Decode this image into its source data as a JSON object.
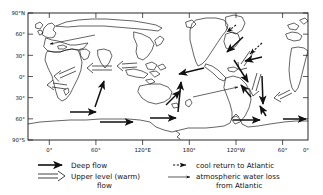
{
  "figure": {
    "type": "map-diagram"
  },
  "axes": {
    "y_labels": [
      "90°N",
      "60°",
      "30°",
      "0°",
      "30°",
      "60°",
      "90°S"
    ],
    "y_values": [
      90,
      60,
      30,
      0,
      -30,
      -60,
      -90
    ],
    "x_labels": [
      "0°",
      "60°",
      "120°E",
      "180°",
      "120°W",
      "60°",
      "0°"
    ],
    "x_values": [
      0,
      60,
      120,
      180,
      240,
      300,
      360
    ],
    "frame_color": "#111111"
  },
  "legend": {
    "items": [
      {
        "symbol": "solid-arrow",
        "label": "Deep  flow"
      },
      {
        "symbol": "hollow-arrow",
        "label": "Upper level (warm)",
        "label2": "flow"
      },
      {
        "symbol": "dashed-short-arrow",
        "label": "cool return to Atlantic"
      },
      {
        "symbol": "thin-line-arrow",
        "label": "atmospheric  water loss",
        "label2": "from  Atlantic"
      }
    ]
  },
  "arrows": {
    "deep_flow": [
      {
        "x1": 70,
        "y1": 112,
        "x2": 98,
        "y2": 112
      },
      {
        "x1": 100,
        "y1": 122,
        "x2": 135,
        "y2": 122
      },
      {
        "x1": 150,
        "y1": 118,
        "x2": 178,
        "y2": 118
      },
      {
        "x1": 233,
        "y1": 120,
        "x2": 262,
        "y2": 120
      },
      {
        "x1": 283,
        "y1": 119,
        "x2": 308,
        "y2": 119
      },
      {
        "x1": 95,
        "y1": 107,
        "x2": 104,
        "y2": 79
      },
      {
        "x1": 178,
        "y1": 112,
        "x2": 181,
        "y2": 80
      },
      {
        "x1": 167,
        "y1": 104,
        "x2": 181,
        "y2": 90
      },
      {
        "x1": 204,
        "y1": 68,
        "x2": 177,
        "y2": 75
      },
      {
        "x1": 243,
        "y1": 37,
        "x2": 225,
        "y2": 53
      },
      {
        "x1": 262,
        "y1": 57,
        "x2": 243,
        "y2": 62
      },
      {
        "x1": 234,
        "y1": 60,
        "x2": 249,
        "y2": 84
      },
      {
        "x1": 250,
        "y1": 96,
        "x2": 239,
        "y2": 83
      },
      {
        "x1": 262,
        "y1": 76,
        "x2": 265,
        "y2": 106
      },
      {
        "x1": 192,
        "y1": 94,
        "x2": 222,
        "y2": 80
      },
      {
        "x1": 266,
        "y1": 116,
        "x2": 259,
        "y2": 104
      }
    ],
    "upper_level_warm": [
      {
        "x1": 73,
        "y1": 69,
        "x2": 56,
        "y2": 77
      },
      {
        "x1": 112,
        "y1": 68,
        "x2": 88,
        "y2": 68
      },
      {
        "x1": 136,
        "y1": 65,
        "x2": 118,
        "y2": 66
      },
      {
        "x1": 66,
        "y1": 87,
        "x2": 48,
        "y2": 84
      },
      {
        "x1": 258,
        "y1": 74,
        "x2": 251,
        "y2": 94
      },
      {
        "x1": 290,
        "y1": 91,
        "x2": 275,
        "y2": 98
      },
      {
        "x1": 249,
        "y1": 52,
        "x2": 238,
        "y2": 67
      }
    ],
    "cool_return": [
      {
        "x1": 262,
        "y1": 43,
        "x2": 248,
        "y2": 55
      },
      {
        "x1": 235,
        "y1": 26,
        "x2": 226,
        "y2": 33
      }
    ],
    "atmospheric_water_loss": [
      {
        "x1": 93,
        "y1": 35,
        "x2": 48,
        "y2": 44
      },
      {
        "x1": 193,
        "y1": 97,
        "x2": 240,
        "y2": 86
      }
    ]
  }
}
